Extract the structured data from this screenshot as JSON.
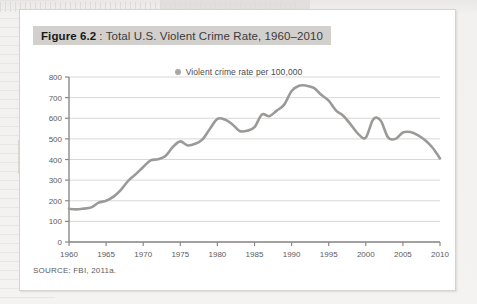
{
  "figure": {
    "label_bold": "Figure 6.2",
    "label_rest": ": Total U.S. Violent Crime Rate, 1960–2010",
    "source": "SOURCE: FBI, 2011a.",
    "colors": {
      "line": "#9b9a98",
      "grid": "#d9d8d6",
      "axis": "#8a8987",
      "title_band": "#d2d0cd",
      "card": "#ffffff",
      "page_bg": "#f1f0ee",
      "text": "#3a3a3c"
    }
  },
  "chart_data": {
    "type": "line",
    "title": "Total U.S. Violent Crime Rate, 1960–2010",
    "xlabel": "",
    "ylabel": "",
    "legend": [
      {
        "name": "Violent crime rate per 100,000",
        "marker": "circle",
        "color": "#a8a7a5"
      }
    ],
    "legend_position": "top-center",
    "grid": true,
    "xlim": [
      1960,
      2010
    ],
    "ylim": [
      0,
      800
    ],
    "yticks": [
      0,
      100,
      200,
      300,
      400,
      500,
      600,
      700,
      800
    ],
    "ytick_labels": [
      "0",
      "100",
      "200",
      "300",
      "400",
      "500",
      "600",
      "700",
      "800"
    ],
    "xticks": [
      1960,
      1965,
      1970,
      1975,
      1980,
      1985,
      1990,
      1995,
      2000,
      2005,
      2010
    ],
    "xtick_labels": [
      "1960",
      "1965",
      "1970",
      "1975",
      "1980",
      "1985",
      "1990",
      "1995",
      "2000",
      "2005",
      "2010"
    ],
    "x": [
      1960,
      1961,
      1962,
      1963,
      1964,
      1965,
      1966,
      1967,
      1968,
      1969,
      1970,
      1971,
      1972,
      1973,
      1974,
      1975,
      1976,
      1977,
      1978,
      1979,
      1980,
      1981,
      1982,
      1983,
      1984,
      1985,
      1986,
      1987,
      1988,
      1989,
      1990,
      1991,
      1992,
      1993,
      1994,
      1995,
      1996,
      1997,
      1998,
      1999,
      2000,
      2001,
      2002,
      2003,
      2004,
      2005,
      2006,
      2007,
      2008,
      2009,
      2010
    ],
    "series": [
      {
        "name": "Violent crime rate per 100,000",
        "color": "#9b9a98",
        "values": [
          161,
          158,
          162,
          168,
          191,
          200,
          220,
          253,
          298,
          329,
          364,
          396,
          401,
          417,
          461,
          488,
          468,
          476,
          498,
          549,
          597,
          594,
          571,
          538,
          539,
          557,
          618,
          610,
          637,
          666,
          732,
          758,
          758,
          747,
          714,
          685,
          637,
          611,
          568,
          523,
          506,
          595,
          589,
          507,
          500,
          531,
          533,
          518,
          493,
          457,
          405
        ]
      }
    ]
  }
}
